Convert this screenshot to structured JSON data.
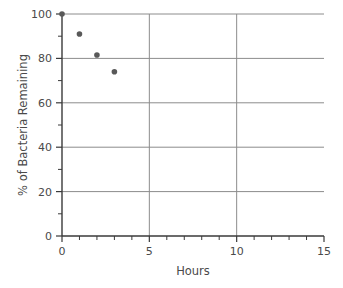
{
  "chart_data": {
    "type": "scatter",
    "title": "",
    "xlabel": "Hours",
    "ylabel": "% of Bacteria Remaining",
    "xlim": [
      0,
      15
    ],
    "ylim": [
      0,
      100
    ],
    "x_major_ticks": [
      0,
      5,
      10,
      15
    ],
    "x_tick_labels": [
      "0",
      "5",
      "10",
      "15"
    ],
    "x_minor_ticks": [
      1,
      2,
      3,
      4,
      6,
      7,
      8,
      9,
      11,
      12,
      13,
      14
    ],
    "y_major_ticks": [
      0,
      20,
      40,
      60,
      80,
      100
    ],
    "y_tick_labels": [
      "0",
      "20",
      "40",
      "60",
      "80",
      "100"
    ],
    "y_minor_ticks": [
      10,
      30,
      50,
      70,
      90
    ],
    "grid": {
      "horizontal": [
        20,
        40,
        60,
        80,
        100
      ],
      "vertical": [
        5,
        10
      ],
      "color": "#8c8c8c"
    },
    "series": [
      {
        "name": "Bacteria remaining",
        "marker": "circle",
        "marker_color": "#595959",
        "marker_size": 5.6,
        "points": [
          {
            "x": 0,
            "y": 100
          },
          {
            "x": 1,
            "y": 91
          },
          {
            "x": 2,
            "y": 81.5
          },
          {
            "x": 3,
            "y": 74
          }
        ]
      }
    ],
    "legend": null,
    "legend_position": "none",
    "axis_color": "#3a3a3a",
    "background": "#ffffff"
  },
  "figure": {
    "xlabel_text": "Hours",
    "ylabel_text": "% of Bacteria Remaining"
  }
}
